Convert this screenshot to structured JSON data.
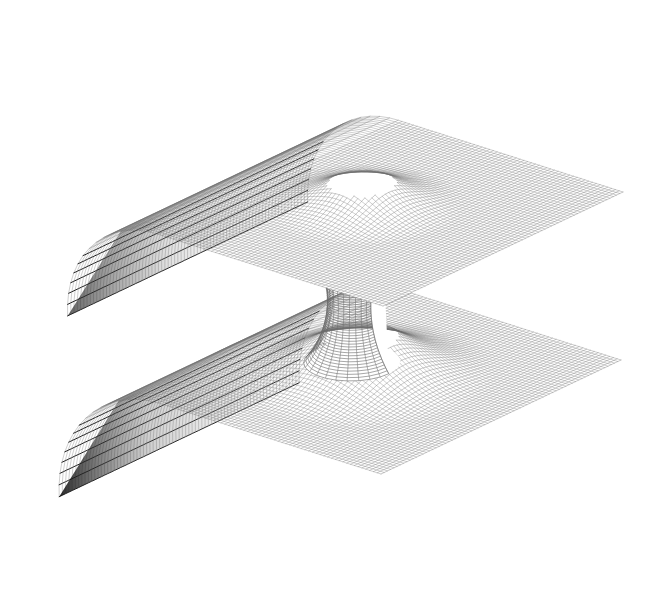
{
  "figure": {
    "kind": "embedding-diagram",
    "render_style": "wireframe-mesh",
    "background_color": "#ffffff",
    "mesh_color": "#6a6a6a",
    "mesh_color_dark": "#111111",
    "fill_color": "#ffffff",
    "sheet_count": 2,
    "throat_label": "throat",
    "upper_sheet_label": "upper sheet",
    "lower_sheet_label": "lower sheet"
  },
  "scan": {
    "bleed_through_lines": [
      "os 1 sisa, suono serio ul imilgnos seri, Op Sp",
      "o osuovisa o ziiluse io ls si  sol ems usdorg o",
      "on o a slidw nosiiso  enoiomuo uo  oi  os ni",
      "so i  soon insaalqmi ous sliosb sas oi osi noo",
      "oniliors sni oi  no  no  siloups si  snoilsvis",
      "on sv  sorimuuo ol siqmis ons sumodq sonio",
      "illiw  uo sud  snoiono  o iq ol nsr  slsm ons"
    ]
  },
  "chart_data": {
    "type": "surface",
    "title": "",
    "xlabel": "",
    "ylabel": "",
    "grid": true,
    "legend": "none",
    "mesh": {
      "u_divisions": 78,
      "v_divisions": 78,
      "line_width": 0.45
    },
    "geometry": {
      "upper_sheet": {
        "corners_px": [
          [
            110,
            188
          ],
          [
            475,
            70
          ],
          [
            660,
            168
          ],
          [
            300,
            300
          ]
        ],
        "rolled_edge": "left",
        "funnel_center_px": [
          352,
          222
        ],
        "funnel_radius_px": 66,
        "funnel_depth_px": 40
      },
      "lower_sheet": {
        "corners_px": [
          [
            95,
            470
          ],
          [
            300,
            320
          ],
          [
            618,
            380
          ],
          [
            390,
            540
          ]
        ],
        "rolled_edge": "left",
        "funnel_center_px": [
          352,
          368
        ],
        "funnel_radius_px": 96,
        "funnel_depth_px": 54
      },
      "throat": {
        "top_px": [
          352,
          252
        ],
        "bottom_px": [
          352,
          372
        ],
        "min_radius_px": 22,
        "ring_count": 14
      }
    }
  }
}
